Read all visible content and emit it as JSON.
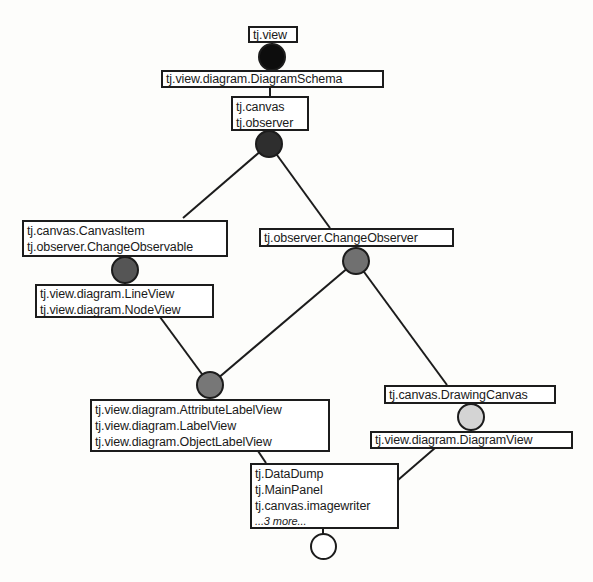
{
  "diagram": {
    "type": "concept lattice of Java packages/classes",
    "boxes": {
      "top": {
        "lines": [
          "tj.view"
        ]
      },
      "schema": {
        "lines": [
          "tj.view.diagram.DiagramSchema"
        ]
      },
      "canvas_observer": {
        "lines": [
          "tj.canvas",
          "tj.observer"
        ]
      },
      "canvas_item": {
        "lines": [
          "tj.canvas.CanvasItem",
          "tj.observer.ChangeObservable"
        ]
      },
      "change_observer": {
        "lines": [
          "tj.observer.ChangeObserver"
        ]
      },
      "line_node": {
        "lines": [
          "tj.view.diagram.LineView",
          "tj.view.diagram.NodeView"
        ]
      },
      "label_views": {
        "lines": [
          "tj.view.diagram.AttributeLabelView",
          "tj.view.diagram.LabelView",
          "tj.view.diagram.ObjectLabelView"
        ]
      },
      "drawing_canvas": {
        "lines": [
          "tj.canvas.DrawingCanvas"
        ]
      },
      "diagram_view": {
        "lines": [
          "tj.view.diagram.DiagramView"
        ]
      },
      "bottom": {
        "lines": [
          "tj.DataDump",
          "tj.MainPanel",
          "tj.canvas.imagewriter"
        ],
        "more": "...3 more..."
      }
    },
    "node_colors": {
      "black": "#0d0d0d",
      "dark": "#2e2e2e",
      "medium": "#6e6e6e",
      "light": "#d4d4d4",
      "white": "#ffffff"
    }
  }
}
